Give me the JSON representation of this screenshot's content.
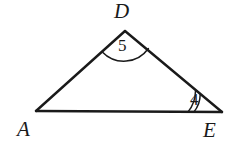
{
  "figure": {
    "kind": "triangle-with-angle-marks",
    "background_color": "#ffffff",
    "stroke_color": "#1a1a1a",
    "vertices": [
      {
        "name": "A",
        "label": "A",
        "x": 36,
        "y": 111
      },
      {
        "name": "D",
        "label": "D",
        "x": 125,
        "y": 31
      },
      {
        "name": "E",
        "label": "E",
        "x": 222,
        "y": 112
      }
    ],
    "sides": [
      {
        "name": "AD",
        "from": "A",
        "to": "D"
      },
      {
        "name": "DE",
        "from": "D",
        "to": "E"
      },
      {
        "name": "AE",
        "from": "A",
        "to": "E"
      }
    ],
    "angle_marks": [
      {
        "at_vertex": "D",
        "label": "5",
        "arc_count": 1,
        "radii": [
          30
        ]
      },
      {
        "at_vertex": "E",
        "label": "4",
        "arc_count": 2,
        "radii": [
          28,
          34
        ]
      }
    ]
  },
  "labels": {
    "vertex_a": "A",
    "vertex_d": "D",
    "vertex_e": "E",
    "angle_five": "5",
    "angle_four": "4"
  }
}
